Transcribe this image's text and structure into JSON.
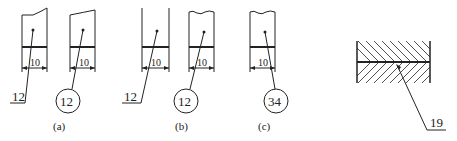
{
  "figure": {
    "parts": [
      {
        "id": "a1",
        "dim": "10",
        "label": "12",
        "label_style": "underline"
      },
      {
        "id": "a2",
        "dim": "10",
        "label": "12",
        "label_style": "circle"
      },
      {
        "id": "b1",
        "dim": "10",
        "label": "12",
        "label_style": "underline"
      },
      {
        "id": "b2",
        "dim": "10",
        "label": "12",
        "label_style": "circle"
      },
      {
        "id": "c1",
        "dim": "10",
        "label": "34",
        "label_style": "circle"
      }
    ],
    "captions": {
      "a": "(a)",
      "b": "(b)",
      "c": "(c)"
    },
    "assembly": {
      "label": "19"
    }
  }
}
